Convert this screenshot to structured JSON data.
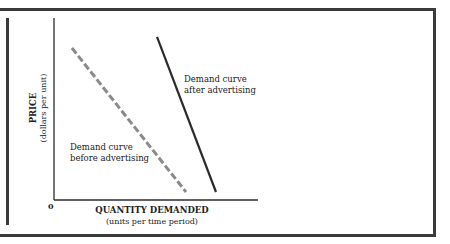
{
  "chart_data": {
    "type": "line",
    "title": "",
    "xlabel": "QUANTITY DEMANDED",
    "xlabel_sub": "(units per time period)",
    "ylabel": "PRICE",
    "ylabel_sub": "(dollars per unit)",
    "origin_label": "0",
    "xlim": [
      0,
      100
    ],
    "ylim": [
      0,
      100
    ],
    "grid": false,
    "units_note": "conceptual diagram; values in normalized units relative to axes",
    "series": [
      {
        "name": "Demand curve before advertising",
        "label_lines": [
          "Demand curve",
          "before advertising"
        ],
        "style": "dashed",
        "color": "#8a8a8a",
        "points": [
          [
            8.8,
            83.5
          ],
          [
            64.7,
            4.4
          ]
        ]
      },
      {
        "name": "Demand curve after advertising",
        "label_lines": [
          "Demand curve",
          "after advertising"
        ],
        "style": "solid",
        "color": "#2b2b2b",
        "points": [
          [
            50.5,
            89.6
          ],
          [
            79.4,
            4.4
          ]
        ]
      }
    ]
  }
}
